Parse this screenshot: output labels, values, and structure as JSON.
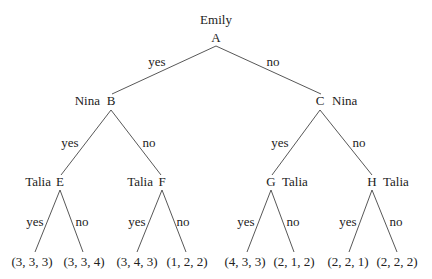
{
  "root": {
    "id": "A",
    "player": "Emily"
  },
  "level1": [
    {
      "id": "B",
      "player": "Nina",
      "edge": "yes"
    },
    {
      "id": "C",
      "player": "Nina",
      "edge": "no"
    }
  ],
  "level2": [
    {
      "id": "E",
      "player": "Talia",
      "edge": "yes"
    },
    {
      "id": "F",
      "player": "Talia",
      "edge": "no"
    },
    {
      "id": "G",
      "player": "Talia",
      "edge": "yes"
    },
    {
      "id": "H",
      "player": "Talia",
      "edge": "no"
    }
  ],
  "leaves": [
    {
      "payoff": "(3, 3, 3)",
      "edge": "yes"
    },
    {
      "payoff": "(3, 3, 4)",
      "edge": "no"
    },
    {
      "payoff": "(3, 4, 3)",
      "edge": "yes"
    },
    {
      "payoff": "(1, 2, 2)",
      "edge": "no"
    },
    {
      "payoff": "(4, 3, 3)",
      "edge": "yes"
    },
    {
      "payoff": "(2, 1, 2)",
      "edge": "no"
    },
    {
      "payoff": "(2, 2, 1)",
      "edge": "yes"
    },
    {
      "payoff": "(2, 2, 2)",
      "edge": "no"
    }
  ]
}
